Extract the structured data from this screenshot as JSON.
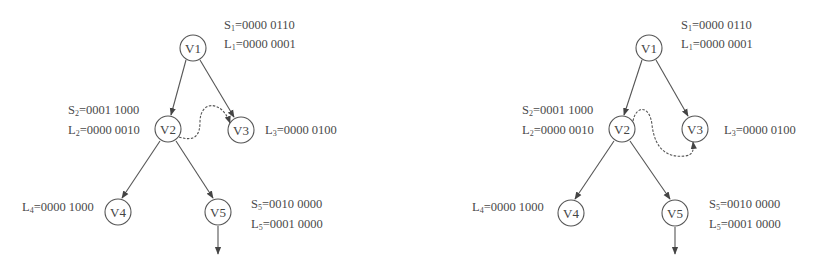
{
  "diagrams": [
    {
      "id": "left",
      "nodes": [
        {
          "id": "V1",
          "label": "V1",
          "cx": 193,
          "cy": 48
        },
        {
          "id": "V2",
          "label": "V2",
          "cx": 168,
          "cy": 129
        },
        {
          "id": "V3",
          "label": "V3",
          "cx": 241,
          "cy": 130
        },
        {
          "id": "V4",
          "label": "V4",
          "cx": 118,
          "cy": 212
        },
        {
          "id": "V5",
          "label": "V5",
          "cx": 218,
          "cy": 212
        }
      ],
      "annotations": {
        "s1": {
          "prefix": "S",
          "sub": "1",
          "value": "=0000 0110"
        },
        "l1": {
          "prefix": "L",
          "sub": "1",
          "value": "=0000 0001"
        },
        "s2": {
          "prefix": "S",
          "sub": "2",
          "value": "=0001 1000"
        },
        "l2": {
          "prefix": "L",
          "sub": "2",
          "value": "=0000 0010"
        },
        "l3": {
          "prefix": "L",
          "sub": "3",
          "value": "=0000 0100"
        },
        "l4": {
          "prefix": "L",
          "sub": "4",
          "value": "=0000 1000"
        },
        "s5": {
          "prefix": "S",
          "sub": "5",
          "value": "=0010 0000"
        },
        "l5": {
          "prefix": "L",
          "sub": "5",
          "value": "=0001 0000"
        }
      },
      "dashed_edge": {
        "from": "V2",
        "to": "V3",
        "style": "dashed-curve-over"
      }
    },
    {
      "id": "right",
      "nodes": [
        {
          "id": "V1",
          "label": "V1",
          "cx": 649,
          "cy": 48
        },
        {
          "id": "V2",
          "label": "V2",
          "cx": 622,
          "cy": 129
        },
        {
          "id": "V3",
          "label": "V3",
          "cx": 695,
          "cy": 129
        },
        {
          "id": "V4",
          "label": "V4",
          "cx": 571,
          "cy": 213
        },
        {
          "id": "V5",
          "label": "V5",
          "cx": 675,
          "cy": 213
        }
      ],
      "annotations": {
        "s1": {
          "prefix": "S",
          "sub": "1",
          "value": "=0000 0110"
        },
        "l1": {
          "prefix": "L",
          "sub": "1",
          "value": "=0000 0001"
        },
        "s2": {
          "prefix": "S",
          "sub": "2",
          "value": "=0001 1000"
        },
        "l2": {
          "prefix": "L",
          "sub": "2",
          "value": "=0000 0010"
        },
        "l3": {
          "prefix": "L",
          "sub": "3",
          "value": "=0000 0100"
        },
        "l4": {
          "prefix": "L",
          "sub": "4",
          "value": "=0000 1000"
        },
        "s5": {
          "prefix": "S",
          "sub": "5",
          "value": "=0010 0000"
        },
        "l5": {
          "prefix": "L",
          "sub": "5",
          "value": "=0001 0000"
        }
      },
      "dashed_edge": {
        "from": "V2",
        "to": "V3",
        "style": "dashed-curve-under"
      }
    }
  ],
  "edges": [
    {
      "from": "V1",
      "to": "V2"
    },
    {
      "from": "V1",
      "to": "V3"
    },
    {
      "from": "V2",
      "to": "V4"
    },
    {
      "from": "V2",
      "to": "V5"
    },
    {
      "from": "V5",
      "to": "out"
    }
  ]
}
